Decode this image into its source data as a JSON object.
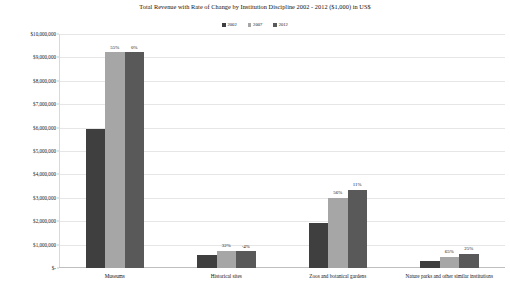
{
  "chart_data": {
    "type": "bar",
    "title": "Total Revenue with Rate of Change by Institution Discipline 2002 - 2012 ($1,000) in US$",
    "xlabel": "",
    "ylabel": "",
    "ylim": [
      0,
      10000000
    ],
    "grid": true,
    "legend_position": "top-center",
    "categories": [
      "Museums",
      "Historical sites",
      "Zoos and botanical gardens",
      "Nature parks and other similar institutions"
    ],
    "ytick_labels": [
      "$10,000,000",
      "$9,000,000",
      "$8,000,000",
      "$7,000,000",
      "$6,000,000",
      "$5,000,000",
      "$4,000,000",
      "$3,000,000",
      "$2,000,000",
      "$1,000,000",
      "$-"
    ],
    "ytick_values": [
      10000000,
      9000000,
      8000000,
      7000000,
      6000000,
      5000000,
      4000000,
      3000000,
      2000000,
      1000000,
      0
    ],
    "series": [
      {
        "name": "2002",
        "color": "#3f3f3f",
        "values": [
          5950000,
          560000,
          1930000,
          290000
        ]
      },
      {
        "name": "2007",
        "color": "#a6a6a6",
        "values": [
          9230000,
          740000,
          3010000,
          480000
        ]
      },
      {
        "name": "2012",
        "color": "#595959",
        "values": [
          9230000,
          710000,
          3340000,
          600000
        ]
      }
    ],
    "data_labels": {
      "2007": [
        "55%",
        "32%",
        "56%",
        "65%"
      ],
      "2012": [
        "0%",
        "-4%",
        "11%",
        "25%"
      ]
    }
  }
}
